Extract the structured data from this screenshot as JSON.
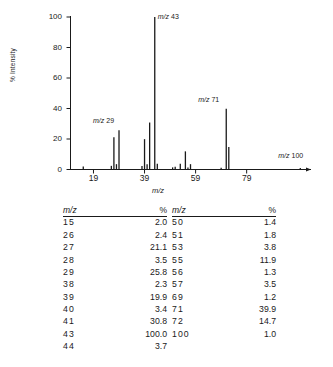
{
  "chart_data": {
    "type": "bar",
    "title": "",
    "xlabel": "m/z",
    "ylabel": "% Intensity",
    "xlim": [
      10,
      104
    ],
    "ylim": [
      0,
      100
    ],
    "grid": false,
    "legend": null,
    "xticks": [
      19,
      39,
      59,
      79
    ],
    "yticks": [
      0,
      20,
      40,
      60,
      80,
      100
    ],
    "x": [
      15,
      26,
      27,
      28,
      29,
      38,
      39,
      40,
      41,
      43,
      44,
      50,
      51,
      53,
      55,
      56,
      57,
      69,
      71,
      72,
      100
    ],
    "values": [
      2.0,
      2.4,
      21.1,
      3.5,
      25.8,
      2.3,
      19.9,
      3.4,
      30.8,
      100.0,
      3.7,
      1.4,
      1.8,
      3.8,
      11.9,
      1.3,
      3.5,
      1.2,
      39.9,
      14.7,
      1.0
    ],
    "annotations": [
      {
        "label_mz": "m/z",
        "label_value": "29",
        "x": 29,
        "y": 25.8
      },
      {
        "label_mz": "m/z",
        "label_value": "43",
        "x": 43,
        "y": 100.0
      },
      {
        "label_mz": "m/z",
        "label_value": "71",
        "x": 71,
        "y": 39.9
      },
      {
        "label_mz": "m/z",
        "label_value": "100",
        "x": 100,
        "y": 1.0
      }
    ]
  },
  "axes": {
    "y_title": "% Intensity",
    "x_title": "m/z",
    "y_tick_labels": [
      "100",
      "80",
      "60",
      "40",
      "20",
      "0"
    ],
    "x_tick_labels": [
      "19",
      "39",
      "59",
      "79"
    ]
  },
  "annotations": [
    {
      "mz_text": "m/z",
      "value_text": "29"
    },
    {
      "mz_text": "m/z",
      "value_text": "43"
    },
    {
      "mz_text": "m/z",
      "value_text": "71"
    },
    {
      "mz_text": "m/z",
      "value_text": "100"
    }
  ],
  "table": {
    "headers": {
      "mz": "m/z",
      "percent": "%"
    },
    "left_rows": [
      {
        "mz": "15",
        "percent": "2.0"
      },
      {
        "mz": "26",
        "percent": "2.4"
      },
      {
        "mz": "27",
        "percent": "21.1"
      },
      {
        "mz": "28",
        "percent": "3.5"
      },
      {
        "mz": "29",
        "percent": "25.8"
      },
      {
        "mz": "38",
        "percent": "2.3"
      },
      {
        "mz": "39",
        "percent": "19.9"
      },
      {
        "mz": "40",
        "percent": "3.4"
      },
      {
        "mz": "41",
        "percent": "30.8"
      },
      {
        "mz": "43",
        "percent": "100.0"
      },
      {
        "mz": "44",
        "percent": "3.7"
      }
    ],
    "right_rows": [
      {
        "mz": "50",
        "percent": "1.4"
      },
      {
        "mz": "51",
        "percent": "1.8"
      },
      {
        "mz": "53",
        "percent": "3.8"
      },
      {
        "mz": "55",
        "percent": "11.9"
      },
      {
        "mz": "56",
        "percent": "1.3"
      },
      {
        "mz": "57",
        "percent": "3.5"
      },
      {
        "mz": "69",
        "percent": "1.2"
      },
      {
        "mz": "71",
        "percent": "39.9"
      },
      {
        "mz": "72",
        "percent": "14.7"
      },
      {
        "mz": "100",
        "percent": "1.0"
      }
    ]
  }
}
